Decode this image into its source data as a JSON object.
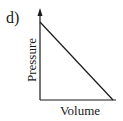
{
  "figure": {
    "panel_label": "d)",
    "xlabel": "Volume",
    "ylabel": "Pressure",
    "line_color": "#1a1a1a"
  },
  "diagram": {
    "type": "pressure-volume graph",
    "axes": {
      "x": {
        "label": "Volume",
        "arrow": false
      },
      "y": {
        "label": "Pressure",
        "arrow": true
      }
    },
    "curve": {
      "shape": "straight line",
      "trend": "decreasing",
      "start": "y-axis near top",
      "end": "x-axis near right end"
    }
  }
}
